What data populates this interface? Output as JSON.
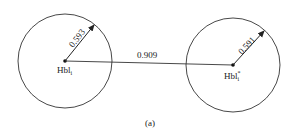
{
  "diagram": {
    "caption": "(a)",
    "distance_label": "0.909",
    "nodes": [
      {
        "label": "Hbl",
        "subscript": "i",
        "superscript": "",
        "radius_label": "0.593"
      },
      {
        "label": "Hbl",
        "subscript": "i",
        "superscript": "*",
        "radius_label": "0.591"
      }
    ],
    "colors": {
      "stroke": "#333333",
      "text": "#222222"
    }
  }
}
